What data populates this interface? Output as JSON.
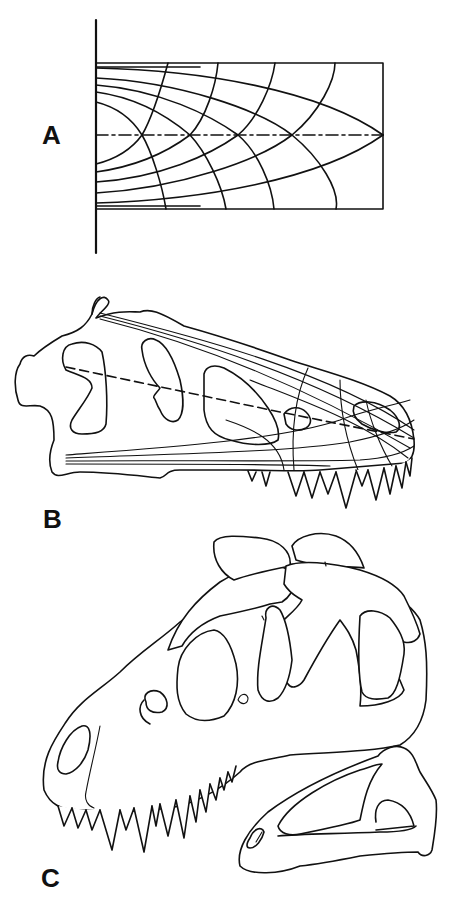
{
  "figure": {
    "background": "#ffffff",
    "ink_color": "#111111",
    "panels": [
      {
        "id": "A",
        "label": "A",
        "description": "Stress trajectories in a cantilever beam fixed to a vertical wall, with dash-dot neutral axis",
        "wall": {
          "x": 96,
          "y1": 20,
          "y2": 253
        },
        "beam_rect": {
          "x": 96,
          "y": 63,
          "width": 287,
          "height": 146
        },
        "neutral_axis_y": 135
      },
      {
        "id": "B",
        "label": "B",
        "description": "Lateral outline of tyrannosaurid skull with superimposed stress trajectory lines and dashed neutral axis"
      },
      {
        "id": "C",
        "label": "C",
        "description": "Stippled lateral view of tyrannosaurid skull with separate outline of lower jaw"
      }
    ]
  }
}
